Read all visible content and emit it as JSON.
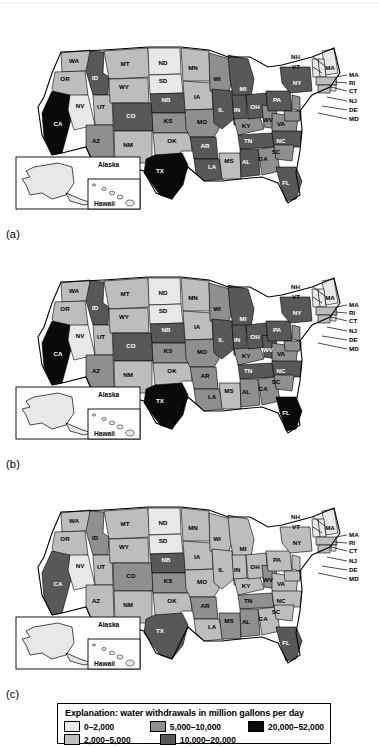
{
  "figure": {
    "panels": [
      {
        "id": "a",
        "label": "(a)"
      },
      {
        "id": "b",
        "label": "(b)"
      },
      {
        "id": "c",
        "label": "(c)"
      }
    ],
    "inset": {
      "alaska_label": "Alaska",
      "hawaii_label": "Hawaii"
    }
  },
  "legend": {
    "title": "Explanation: water withdrawals in million gallons per day",
    "classes": [
      {
        "key": "c1",
        "label": "0–2,000",
        "color": "#e8e8e8"
      },
      {
        "key": "c2",
        "label": "2,000–5,000",
        "color": "#bdbdbd"
      },
      {
        "key": "c3",
        "label": "5,000–10,000",
        "color": "#8f8f8f"
      },
      {
        "key": "c4",
        "label": "10,000–20,000",
        "color": "#585858"
      },
      {
        "key": "c5",
        "label": "20,000–52,000",
        "color": "#0a0a0a"
      }
    ],
    "rows": [
      [
        "c1",
        "c3",
        "c5"
      ],
      [
        "c2",
        "c4"
      ]
    ]
  },
  "callouts": {
    "left": [
      {
        "label": "NH",
        "x": 300,
        "y": 26,
        "lx1": 313,
        "ly1": 24,
        "lx2": 325,
        "ly2": 33
      },
      {
        "label": "VT",
        "x": 300,
        "y": 36,
        "lx1": 313,
        "ly1": 34,
        "lx2": 322,
        "ly2": 40
      }
    ],
    "right": [
      {
        "label": "MA",
        "x": 349,
        "y": 44,
        "lx1": 347,
        "ly1": 42,
        "lx2": 336,
        "ly2": 44
      },
      {
        "label": "RI",
        "x": 349,
        "y": 52,
        "lx1": 347,
        "ly1": 50,
        "lx2": 335,
        "ly2": 49
      },
      {
        "label": "CT",
        "x": 349,
        "y": 60,
        "lx1": 347,
        "ly1": 58,
        "lx2": 331,
        "ly2": 54
      },
      {
        "label": "NJ",
        "x": 349,
        "y": 70,
        "lx1": 347,
        "ly1": 68,
        "lx2": 327,
        "ly2": 64
      },
      {
        "label": "DE",
        "x": 349,
        "y": 79,
        "lx1": 347,
        "ly1": 77,
        "lx2": 322,
        "ly2": 73
      },
      {
        "label": "MD",
        "x": 349,
        "y": 88,
        "lx1": 347,
        "ly1": 86,
        "lx2": 318,
        "ly2": 80
      }
    ],
    "in_map": [
      {
        "label": "MA",
        "x": 330,
        "y": 37
      }
    ]
  },
  "states": [
    {
      "id": "WA",
      "lx": 74,
      "ly": 30
    },
    {
      "id": "OR",
      "lx": 65,
      "ly": 48
    },
    {
      "id": "CA",
      "lx": 58,
      "ly": 93
    },
    {
      "id": "ID",
      "lx": 95,
      "ly": 47
    },
    {
      "id": "NV",
      "lx": 80,
      "ly": 75
    },
    {
      "id": "UT",
      "lx": 101,
      "ly": 76
    },
    {
      "id": "AZ",
      "lx": 96,
      "ly": 110
    },
    {
      "id": "MT",
      "lx": 125,
      "ly": 33
    },
    {
      "id": "WY",
      "lx": 124,
      "ly": 56
    },
    {
      "id": "CO",
      "lx": 131,
      "ly": 85
    },
    {
      "id": "NM",
      "lx": 128,
      "ly": 114
    },
    {
      "id": "ND",
      "lx": 163,
      "ly": 32
    },
    {
      "id": "SD",
      "lx": 163,
      "ly": 50
    },
    {
      "id": "NB",
      "lx": 166,
      "ly": 69
    },
    {
      "id": "KS",
      "lx": 168,
      "ly": 90
    },
    {
      "id": "OK",
      "lx": 172,
      "ly": 110
    },
    {
      "id": "TX",
      "lx": 160,
      "ly": 140
    },
    {
      "id": "MN",
      "lx": 193,
      "ly": 37
    },
    {
      "id": "IA",
      "lx": 197,
      "ly": 66
    },
    {
      "id": "MO",
      "lx": 202,
      "ly": 91
    },
    {
      "id": "AR",
      "lx": 205,
      "ly": 115
    },
    {
      "id": "LA",
      "lx": 212,
      "ly": 136
    },
    {
      "id": "WI",
      "lx": 217,
      "ly": 48
    },
    {
      "id": "IL",
      "lx": 221,
      "ly": 79
    },
    {
      "id": "MS",
      "lx": 229,
      "ly": 130
    },
    {
      "id": "MI",
      "lx": 243,
      "ly": 58
    },
    {
      "id": "IN",
      "lx": 237,
      "ly": 79
    },
    {
      "id": "KY",
      "lx": 246,
      "ly": 95
    },
    {
      "id": "TN",
      "lx": 248,
      "ly": 110
    },
    {
      "id": "AL",
      "lx": 246,
      "ly": 131
    },
    {
      "id": "GA",
      "lx": 263,
      "ly": 128
    },
    {
      "id": "OH",
      "lx": 255,
      "ly": 76
    },
    {
      "id": "WV",
      "lx": 268,
      "ly": 89
    },
    {
      "id": "VA",
      "lx": 281,
      "ly": 93
    },
    {
      "id": "NC",
      "lx": 281,
      "ly": 110
    },
    {
      "id": "SC",
      "lx": 276,
      "ly": 121
    },
    {
      "id": "FL",
      "lx": 286,
      "ly": 152
    },
    {
      "id": "PA",
      "lx": 277,
      "ly": 69
    },
    {
      "id": "NY",
      "lx": 297,
      "ly": 52
    }
  ],
  "chart_data": {
    "type": "map",
    "title": "Explanation: water withdrawals in million gallons per day",
    "units": "million gallons per day",
    "panels": [
      {
        "id": "a",
        "label": "(a)",
        "values": {
          "WA": "c2",
          "OR": "c2",
          "CA": "c5",
          "ID": "c4",
          "NV": "c1",
          "UT": "c2",
          "AZ": "c3",
          "MT": "c2",
          "WY": "c2",
          "CO": "c4",
          "NM": "c2",
          "ND": "c1",
          "SD": "c1",
          "NB": "c4",
          "KS": "c3",
          "OK": "c2",
          "TX": "c5",
          "MN": "c2",
          "IA": "c2",
          "MO": "c3",
          "AR": "c4",
          "LA": "c4",
          "WI": "c3",
          "IL": "c4",
          "MS": "c2",
          "MI": "c4",
          "IN": "c4",
          "KY": "c3",
          "TN": "c4",
          "AL": "c4",
          "GA": "c3",
          "OH": "c4",
          "WV": "c3",
          "VA": "c3",
          "NC": "c4",
          "SC": "c3",
          "FL": "c4",
          "PA": "c4",
          "NY": "c4",
          "ME": "c1",
          "NH": "c1",
          "VT": "c1",
          "MA": "c2",
          "RI": "c1",
          "CT": "c2",
          "NJ": "c3",
          "DE": "c1",
          "MD": "c3",
          "AK": "c1",
          "HI": "c1"
        }
      },
      {
        "id": "b",
        "label": "(b)",
        "values": {
          "WA": "c2",
          "OR": "c2",
          "CA": "c5",
          "ID": "c4",
          "NV": "c1",
          "UT": "c2",
          "AZ": "c3",
          "MT": "c2",
          "WY": "c2",
          "CO": "c4",
          "NM": "c2",
          "ND": "c1",
          "SD": "c1",
          "NB": "c4",
          "KS": "c3",
          "OK": "c2",
          "TX": "c5",
          "MN": "c2",
          "IA": "c2",
          "MO": "c3",
          "AR": "c3",
          "LA": "c3",
          "WI": "c3",
          "IL": "c4",
          "MS": "c2",
          "MI": "c4",
          "IN": "c4",
          "KY": "c3",
          "TN": "c4",
          "AL": "c3",
          "GA": "c3",
          "OH": "c4",
          "WV": "c4",
          "VA": "c3",
          "NC": "c4",
          "SC": "c3",
          "FL": "c5",
          "PA": "c4",
          "NY": "c4",
          "ME": "c1",
          "NH": "c1",
          "VT": "c1",
          "MA": "c2",
          "RI": "c1",
          "CT": "c2",
          "NJ": "c3",
          "DE": "c1",
          "MD": "c3",
          "AK": "c1",
          "HI": "c1"
        }
      },
      {
        "id": "c",
        "label": "(c)",
        "values": {
          "WA": "c2",
          "OR": "c2",
          "CA": "c4",
          "ID": "c3",
          "NV": "c1",
          "UT": "c2",
          "AZ": "c2",
          "MT": "c2",
          "WY": "c2",
          "CO": "c3",
          "NM": "c2",
          "ND": "c1",
          "SD": "c1",
          "NB": "c4",
          "KS": "c3",
          "OK": "c2",
          "TX": "c4",
          "MN": "c2",
          "IA": "c2",
          "MO": "c2",
          "AR": "c3",
          "LA": "c2",
          "WI": "c2",
          "IL": "c2",
          "MS": "c3",
          "MI": "c2",
          "IN": "c2",
          "KY": "c2",
          "TN": "c3",
          "AL": "c3",
          "GA": "c2",
          "OH": "c2",
          "WV": "c3",
          "VA": "c2",
          "NC": "c2",
          "SC": "c2",
          "FL": "c4",
          "PA": "c2",
          "NY": "c2",
          "ME": "c1",
          "NH": "c1",
          "VT": "c1",
          "MA": "c2",
          "RI": "c1",
          "CT": "c2",
          "NJ": "c2",
          "DE": "c1",
          "MD": "c2",
          "AK": "c1",
          "HI": "c1"
        }
      }
    ]
  }
}
